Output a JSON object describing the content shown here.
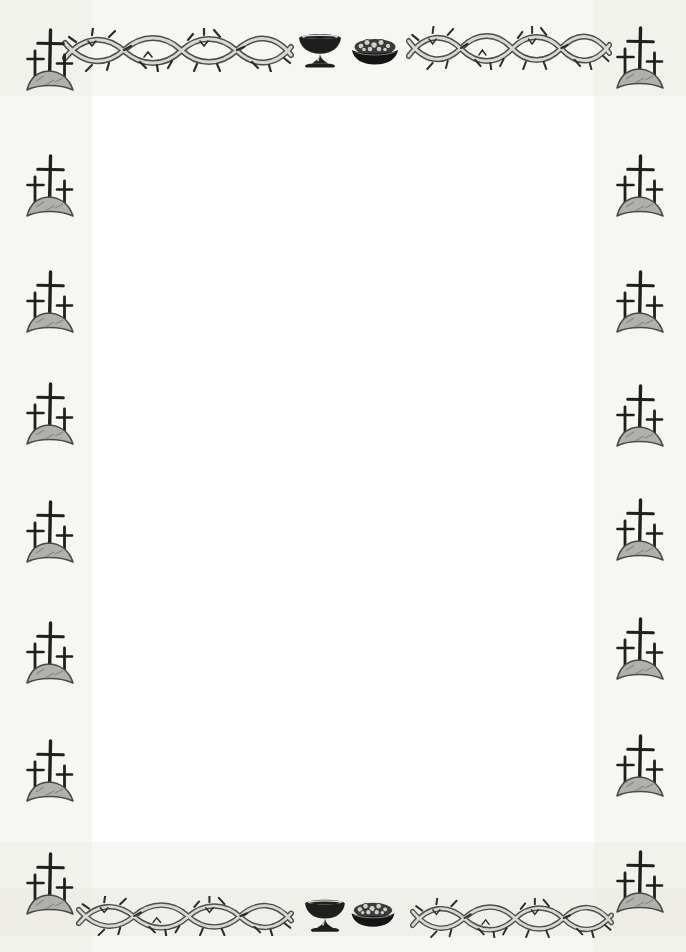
{
  "page": {
    "kind": "decorative blank stationery page",
    "background": "#ffffff",
    "paper_tint": "#eeeee8",
    "ink_dark": "#1f1f1f",
    "ink_mid": "#4d4d4d",
    "ink_light": "#d8d8d4",
    "mound_fill": "#b0b0ae",
    "mound_stroke": "#4a4a4a",
    "thorn_color": "#2d2d2d",
    "bread_fill": "#3b3b39",
    "bowl_fill": "#141414",
    "chunk_fill": "#cfcfca"
  },
  "border": {
    "style": "hand-sketched religious border",
    "corner_motif": "three-crosses-on-hill",
    "garland_motif": "crown-of-thorns-vine",
    "center_icons": [
      "communion-chalice-icon",
      "bread-bowl-icon"
    ],
    "left_column": {
      "motif": "three-crosses-on-hill",
      "x": 22,
      "ys": [
        26,
        152,
        268,
        380,
        498,
        619,
        737,
        850
      ]
    },
    "right_column": {
      "motif": "three-crosses-on-hill",
      "x": 612,
      "ys": [
        24,
        152,
        268,
        382,
        496,
        615,
        732,
        848
      ]
    },
    "top_row": {
      "left_garland": {
        "x": 62,
        "y": 28,
        "w": 232,
        "h": 44
      },
      "chalice": {
        "x": 296,
        "y": 30,
        "w": 48,
        "h": 40
      },
      "bread": {
        "x": 350,
        "y": 37,
        "w": 50,
        "h": 30
      },
      "right_garland": {
        "x": 406,
        "y": 26,
        "w": 206,
        "h": 44
      }
    },
    "bottom_row": {
      "left_garland": {
        "x": 76,
        "y": 896,
        "w": 218,
        "h": 40
      },
      "chalice": {
        "x": 302,
        "y": 896,
        "w": 46,
        "h": 38
      },
      "bread": {
        "x": 349,
        "y": 901,
        "w": 48,
        "h": 28
      },
      "right_garland": {
        "x": 410,
        "y": 898,
        "w": 204,
        "h": 40
      }
    },
    "content_area_text": ""
  }
}
